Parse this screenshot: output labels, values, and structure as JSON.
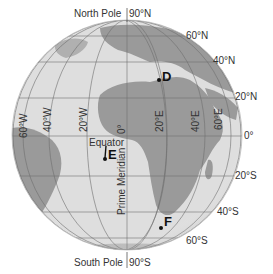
{
  "colors": {
    "ocean": "#dedede",
    "land": "#9a9a9a",
    "grid": "#6e6e6e",
    "text": "#333333",
    "marker": "#111111"
  },
  "poles": {
    "north": "North Pole",
    "north_value": "90°N",
    "south": "South Pole",
    "south_value": "90°S"
  },
  "latitudes": {
    "n60": "60°N",
    "n40": "40°N",
    "n20": "20°N",
    "eq": "0°",
    "s20": "20°S",
    "s40": "40°S",
    "s60": "60°S"
  },
  "longitudes": {
    "w60": "60°W",
    "w40": "40°W",
    "w20": "20°W",
    "zero": "0°",
    "e20": "20°E",
    "e40": "40°E",
    "e60": "60°E"
  },
  "lines": {
    "equator": "Equator",
    "prime_meridian": "Prime Meridian"
  },
  "markers": {
    "d": "D",
    "e": "E",
    "f": "F"
  }
}
